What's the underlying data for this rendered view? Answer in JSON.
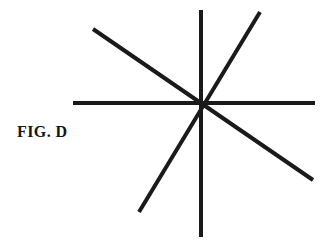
{
  "figure": {
    "label": "FIG. D",
    "background_color": "#ffffff",
    "stroke_color": "#1a1a1a",
    "stroke_width": 4,
    "canvas": {
      "width": 333,
      "height": 245
    },
    "center": {
      "x": 202,
      "y": 103
    },
    "spoke_count": 8,
    "lines": [
      {
        "name": "horizontal-line",
        "x1": 73,
        "y1": 103,
        "x2": 315,
        "y2": 103
      },
      {
        "name": "vertical-line",
        "x1": 201,
        "y1": 10,
        "x2": 201,
        "y2": 237
      },
      {
        "name": "diagonal-ne-sw-line",
        "x1": 260,
        "y1": 12,
        "x2": 139,
        "y2": 212
      },
      {
        "name": "diagonal-nw-se-line",
        "x1": 93,
        "y1": 29,
        "x2": 313,
        "y2": 180
      }
    ]
  }
}
